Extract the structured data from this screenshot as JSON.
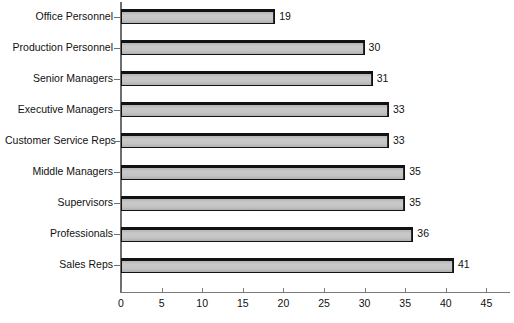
{
  "chart": {
    "type": "bar",
    "orientation": "horizontal",
    "title": "",
    "xlabel": "",
    "ylabel": ""
  },
  "chart_data": {
    "type": "bar",
    "orientation": "horizontal",
    "title": "",
    "subtitle": "",
    "xlabel": "",
    "ylabel": "",
    "xlim": [
      0,
      48
    ],
    "ylim": null,
    "grid": false,
    "legend": null,
    "categories": [
      "Office Personnel",
      "Production Personnel",
      "Senior Managers",
      "Executive Managers",
      "Customer Service Reps",
      "Middle Managers",
      "Supervisors",
      "Professionals",
      "Sales Reps"
    ],
    "values": [
      19,
      30,
      31,
      33,
      33,
      35,
      35,
      36,
      41
    ],
    "data_labels": [
      "19",
      "30",
      "31",
      "33",
      "33",
      "35",
      "35",
      "36",
      "41"
    ],
    "x_ticks": [
      0,
      5,
      10,
      15,
      20,
      25,
      30,
      35,
      40,
      45
    ],
    "x_tick_labels": [
      "0",
      "5",
      "10",
      "15",
      "20",
      "25",
      "30",
      "35",
      "40",
      "45"
    ],
    "colors": {
      "bar_fill": "#c4c4c4",
      "bar_border": "#121212",
      "axis": "#6e6e6e",
      "text": "#111111",
      "background": "#ffffff"
    }
  }
}
